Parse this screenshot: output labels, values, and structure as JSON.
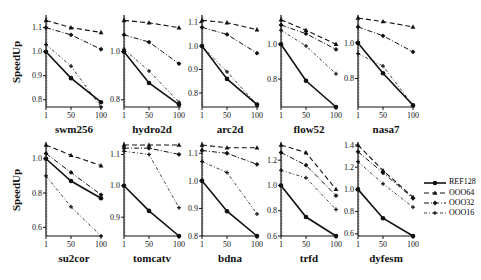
{
  "chart_data": {
    "type": "line",
    "ylabel": "SpeedUp",
    "x": [
      1,
      50,
      100
    ],
    "legend": [
      "REF128",
      "OOO64",
      "OOO32",
      "OOO16"
    ],
    "panels": [
      {
        "title": "swm256",
        "ylim": [
          0.77,
          1.14
        ],
        "yticks": [
          0.8,
          0.9,
          1.0,
          1.1
        ],
        "series": [
          {
            "name": "REF128",
            "values": [
              1.0,
              0.89,
              0.79
            ]
          },
          {
            "name": "OOO64",
            "values": [
              1.13,
              1.1,
              1.08
            ]
          },
          {
            "name": "OOO32",
            "values": [
              1.1,
              1.07,
              1.01
            ]
          },
          {
            "name": "OOO16",
            "values": [
              1.03,
              0.94,
              0.77
            ]
          }
        ]
      },
      {
        "title": "hydro2d",
        "ylim": [
          0.77,
          1.14
        ],
        "yticks": [
          0.8,
          1.0
        ],
        "series": [
          {
            "name": "REF128",
            "values": [
              1.0,
              0.87,
              0.78
            ]
          },
          {
            "name": "OOO64",
            "values": [
              1.13,
              1.12,
              1.1
            ]
          },
          {
            "name": "OOO32",
            "values": [
              1.07,
              1.04,
              0.95
            ]
          },
          {
            "name": "OOO16",
            "values": [
              1.01,
              0.92,
              0.79
            ]
          }
        ]
      },
      {
        "title": "arc2d",
        "ylim": [
          0.74,
          1.12
        ],
        "yticks": [
          0.8,
          0.9,
          1.0,
          1.1
        ],
        "series": [
          {
            "name": "REF128",
            "values": [
              1.0,
              0.86,
              0.75
            ]
          },
          {
            "name": "OOO64",
            "values": [
              1.11,
              1.1,
              1.07
            ]
          },
          {
            "name": "OOO32",
            "values": [
              1.08,
              1.05,
              0.97
            ]
          },
          {
            "name": "OOO16",
            "values": [
              1.0,
              0.89,
              0.75
            ]
          }
        ]
      },
      {
        "title": "flow52",
        "ylim": [
          0.64,
          1.15
        ],
        "yticks": [
          0.8,
          1.0
        ],
        "series": [
          {
            "name": "REF128",
            "values": [
              1.0,
              0.79,
              0.64
            ]
          },
          {
            "name": "OOO64",
            "values": [
              1.14,
              1.08,
              1.0
            ]
          },
          {
            "name": "OOO32",
            "values": [
              1.11,
              1.06,
              0.97
            ]
          },
          {
            "name": "OOO16",
            "values": [
              1.08,
              0.99,
              0.83
            ]
          }
        ]
      },
      {
        "title": "nasa7",
        "ylim": [
          0.64,
          1.14
        ],
        "yticks": [
          0.8,
          1.0
        ],
        "series": [
          {
            "name": "REF128",
            "values": [
              1.0,
              0.83,
              0.65
            ]
          },
          {
            "name": "OOO64",
            "values": [
              1.14,
              1.12,
              1.09
            ]
          },
          {
            "name": "OOO32",
            "values": [
              1.09,
              1.04,
              0.95
            ]
          },
          {
            "name": "OOO16",
            "values": [
              0.94,
              0.87,
              0.65
            ]
          }
        ]
      },
      {
        "title": "su2cor",
        "ylim": [
          0.55,
          1.08
        ],
        "yticks": [
          0.6,
          0.8,
          1.0
        ],
        "series": [
          {
            "name": "REF128",
            "values": [
              1.0,
              0.87,
              0.77
            ]
          },
          {
            "name": "OOO64",
            "values": [
              1.08,
              1.02,
              0.96
            ]
          },
          {
            "name": "OOO32",
            "values": [
              1.03,
              0.92,
              0.79
            ]
          },
          {
            "name": "OOO16",
            "values": [
              0.9,
              0.72,
              0.55
            ]
          }
        ]
      },
      {
        "title": "tomcatv",
        "ylim": [
          0.84,
          1.13
        ],
        "yticks": [
          0.9,
          1.0,
          1.1
        ],
        "series": [
          {
            "name": "REF128",
            "values": [
              1.0,
              0.92,
              0.84
            ]
          },
          {
            "name": "OOO64",
            "values": [
              1.13,
              1.13,
              1.13
            ]
          },
          {
            "name": "OOO32",
            "values": [
              1.12,
              1.12,
              1.1
            ]
          },
          {
            "name": "OOO16",
            "values": [
              1.11,
              1.1,
              0.93
            ]
          }
        ]
      },
      {
        "title": "bdna",
        "ylim": [
          0.8,
          1.13
        ],
        "yticks": [
          0.8,
          0.9,
          1.0,
          1.1
        ],
        "series": [
          {
            "name": "REF128",
            "values": [
              1.0,
              0.89,
              0.8
            ]
          },
          {
            "name": "OOO64",
            "values": [
              1.13,
              1.12,
              1.12
            ]
          },
          {
            "name": "OOO32",
            "values": [
              1.11,
              1.1,
              1.06
            ]
          },
          {
            "name": "OOO16",
            "values": [
              1.07,
              1.03,
              0.88
            ]
          }
        ]
      },
      {
        "title": "trfd",
        "ylim": [
          0.6,
          1.32
        ],
        "yticks": [
          0.6,
          0.8,
          1.0,
          1.2
        ],
        "series": [
          {
            "name": "REF128",
            "values": [
              1.0,
              0.75,
              0.6
            ]
          },
          {
            "name": "OOO64",
            "values": [
              1.32,
              1.26,
              0.97
            ]
          },
          {
            "name": "OOO32",
            "values": [
              1.26,
              1.16,
              0.92
            ]
          },
          {
            "name": "OOO16",
            "values": [
              1.12,
              1.06,
              0.81
            ]
          }
        ]
      },
      {
        "title": "dyfesm",
        "ylim": [
          0.58,
          1.4
        ],
        "yticks": [
          0.6,
          0.8,
          1.0,
          1.2,
          1.4
        ],
        "series": [
          {
            "name": "REF128",
            "values": [
              1.0,
              0.74,
              0.58
            ]
          },
          {
            "name": "OOO64",
            "values": [
              1.4,
              1.17,
              0.93
            ]
          },
          {
            "name": "OOO32",
            "values": [
              1.34,
              1.15,
              0.92
            ]
          },
          {
            "name": "OOO16",
            "values": [
              1.25,
              1.05,
              0.84
            ]
          }
        ]
      }
    ]
  },
  "legend": {
    "items": [
      {
        "label": "REF128",
        "style": "solid",
        "marker": "circle"
      },
      {
        "label": "OOO64",
        "style": "dash",
        "marker": "triangle"
      },
      {
        "label": "OOO32",
        "style": "dashdot",
        "marker": "diamond"
      },
      {
        "label": "OOO16",
        "style": "dashdot2",
        "marker": "plus"
      }
    ]
  }
}
